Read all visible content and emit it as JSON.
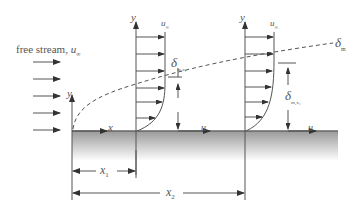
{
  "labels": {
    "free_stream": "free stream, ",
    "free_stream_var": "u",
    "free_stream_sub": "∞",
    "y_axis_origin": "y",
    "x_axis_origin": "x",
    "profile1_y": "y",
    "profile1_u_inf": "u",
    "profile1_u_inf_sub": "∞",
    "profile1_u": "u",
    "profile1_delta": "δ",
    "profile1_delta_sub": "m,x₁",
    "profile2_y": "y",
    "profile2_u_inf": "u",
    "profile2_u_inf_sub": "∞",
    "profile2_u": "u",
    "profile2_delta": "δ",
    "profile2_delta_sub": "m,x₂",
    "boundary_layer": "δ",
    "boundary_layer_sub": "m",
    "dim_x1": "x",
    "dim_x1_sub": "1",
    "dim_x2": "x",
    "dim_x2_sub": "2"
  },
  "colors": {
    "line": "#444444",
    "plate_top": "#9a9a9a",
    "plate_bottom": "#ffffff",
    "text": "#555555"
  }
}
